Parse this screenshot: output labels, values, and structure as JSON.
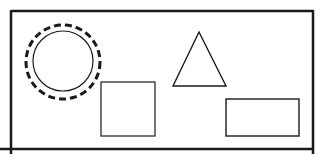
{
  "diagram": {
    "width": 322,
    "height": 154,
    "background": "#ffffff",
    "stroke_color": "#1a1a1a",
    "frame": {
      "left_line": {
        "x": 11,
        "y1": 10,
        "y2": 154
      },
      "top_line": {
        "x1": 11,
        "x2": 314,
        "y": 11
      },
      "right_line": {
        "x": 313,
        "y1": 10,
        "y2": 154
      },
      "bottom_line": {
        "x1": 0,
        "x2": 314,
        "y": 149
      },
      "stroke_width": 2.5
    },
    "shapes": [
      {
        "type": "circle",
        "style": "dashed",
        "cx": 63,
        "cy": 62,
        "r": 37,
        "stroke_width": 3,
        "dash": "7,4"
      },
      {
        "type": "circle",
        "style": "solid",
        "cx": 63,
        "cy": 61,
        "r": 30,
        "stroke_width": 1.2
      },
      {
        "type": "square",
        "x": 101,
        "y": 82,
        "width": 54,
        "height": 54,
        "stroke_width": 1.2
      },
      {
        "type": "triangle",
        "points": "199,32 173,86 226,86",
        "stroke_width": 1.4
      },
      {
        "type": "rectangle",
        "x": 226,
        "y": 99,
        "width": 73,
        "height": 37,
        "stroke_width": 1.4
      }
    ]
  }
}
